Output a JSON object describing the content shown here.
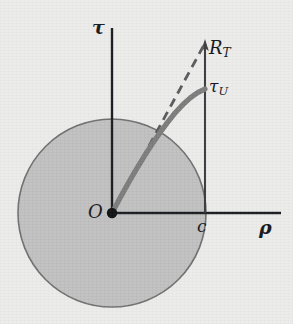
{
  "figure": {
    "type": "diagram",
    "background_color": "#ececeb",
    "axis_color": "#1b1c20",
    "circle_fill_color": "#bdbdbd",
    "circle_stroke_color": "#6d6d6d",
    "curve_color": "#7b7b7b",
    "dashed_color": "#5c5c5c"
  },
  "axes": {
    "vertical_label": "τ",
    "horizontal_label": "ρ",
    "origin_label": "O",
    "origin_x": 112,
    "origin_y": 213,
    "vertical_top_y": 28,
    "horizontal_right_x": 281
  },
  "ticks": {
    "c_label": "c",
    "c_x": 205
  },
  "annotations": [
    {
      "name": "asymptote-label",
      "base": "R",
      "subscript": "T",
      "x": 209,
      "y": 39
    },
    {
      "name": "curve-label",
      "base": "τ",
      "subscript": "U",
      "x": 209,
      "y": 78
    }
  ],
  "circle": {
    "center_x": 112,
    "center_y": 213,
    "radius": 94
  },
  "curve": {
    "start_x": 112,
    "start_y": 213,
    "end_x": 205,
    "end_y": 89,
    "stroke_width": 5
  },
  "dashed_line": {
    "start_x": 112,
    "start_y": 213,
    "end_x": 205,
    "end_y": 44,
    "dash": "8 6",
    "stroke_width": 3
  },
  "vertical_segment": {
    "x": 205,
    "bottom_y": 213,
    "top_y": 44,
    "arrowhead": true
  }
}
